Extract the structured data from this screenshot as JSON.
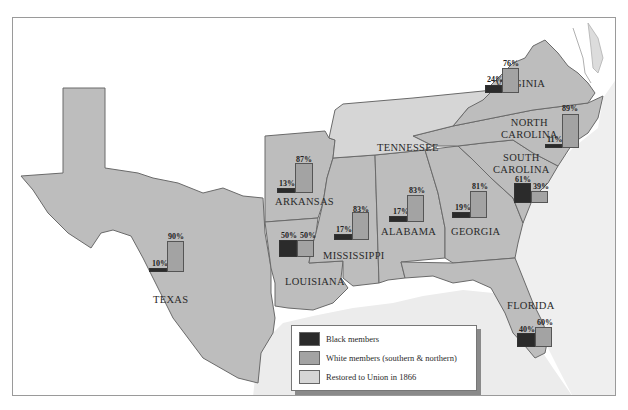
{
  "map": {
    "title": "",
    "colors": {
      "black_members": "#2b2b2b",
      "white_members": "#a3a3a3",
      "restored_1866": "#d6d6d6",
      "reconstruction_state": "#bdbdbd",
      "gulf": "#ececec",
      "outline": "#6a6a6a"
    },
    "states": [
      {
        "name": "VIRGINIA",
        "black_pct": "24%",
        "white_pct": "76%",
        "black": 24,
        "white": 76
      },
      {
        "name": "NORTH CAROLINA",
        "line1": "NORTH",
        "line2": "CAROLINA",
        "black_pct": "11%",
        "white_pct": "89%",
        "black": 11,
        "white": 89
      },
      {
        "name": "SOUTH CAROLINA",
        "line1": "SOUTH",
        "line2": "CAROLINA",
        "black_pct": "61%",
        "white_pct": "39%",
        "black": 61,
        "white": 39
      },
      {
        "name": "GEORGIA",
        "black_pct": "19%",
        "white_pct": "81%",
        "black": 19,
        "white": 81
      },
      {
        "name": "FLORIDA",
        "black_pct": "40%",
        "white_pct": "60%",
        "black": 40,
        "white": 60
      },
      {
        "name": "ALABAMA",
        "black_pct": "17%",
        "white_pct": "83%",
        "black": 17,
        "white": 83
      },
      {
        "name": "MISSISSIPPI",
        "black_pct": "17%",
        "white_pct": "83%",
        "black": 17,
        "white": 83
      },
      {
        "name": "LOUISIANA",
        "black_pct": "50%",
        "white_pct": "50%",
        "black": 50,
        "white": 50
      },
      {
        "name": "ARKANSAS",
        "black_pct": "13%",
        "white_pct": "87%",
        "black": 13,
        "white": 87
      },
      {
        "name": "TEXAS",
        "black_pct": "10%",
        "white_pct": "90%",
        "black": 10,
        "white": 90
      },
      {
        "name": "TENNESSEE",
        "note": "Restored to Union in 1866"
      }
    ],
    "legend": {
      "items": [
        {
          "label": "Black members",
          "color": "#2b2b2b"
        },
        {
          "label": "White members (southern & northern)",
          "color": "#a3a3a3"
        },
        {
          "label": "Restored to Union in 1866",
          "color": "#d6d6d6"
        }
      ]
    }
  }
}
